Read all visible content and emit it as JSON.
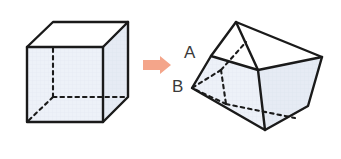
{
  "figure": {
    "canvas": {
      "width": 341,
      "height": 159,
      "background": "#ffffff"
    },
    "colors": {
      "face_fill": "#edf1f8",
      "face_fill_shaded": "#e7ecf5",
      "face_fill_top": "#ffffff",
      "edge_stroke": "#1a1a1a",
      "hidden_stroke": "#1a1a1a",
      "arrow_fill": "#f4a58a",
      "label_color": "#3a3a3a"
    },
    "arrow": {
      "name": "transform-arrow",
      "direction": "right",
      "color": "#f4a58a",
      "x": 143,
      "y": 56,
      "width": 28,
      "height": 18
    },
    "labels": [
      {
        "id": "A",
        "text": "A",
        "x": 184,
        "y": 44
      },
      {
        "id": "B",
        "text": "B",
        "x": 172,
        "y": 78
      }
    ],
    "shapes": [
      {
        "name": "upright-cube",
        "description": "Standard axonometric cube, front face square, hidden back edges dashed",
        "vertices": {
          "front_top_left": [
            27,
            47
          ],
          "front_top_right": [
            103,
            47
          ],
          "front_bottom_right": [
            103,
            122
          ],
          "front_bottom_left": [
            27,
            122
          ],
          "back_top_left": [
            53,
            22
          ],
          "back_top_right": [
            128,
            22
          ],
          "back_bottom_right": [
            128,
            97
          ],
          "back_bottom_left": [
            53,
            97
          ]
        },
        "visible_faces": [
          "front",
          "top",
          "right"
        ],
        "hidden_edges": [
          "back_bottom_left-front_bottom_left",
          "back_bottom_left-back_top_left",
          "back_bottom_left-back_bottom_right"
        ]
      },
      {
        "name": "tilted-cube",
        "description": "Same cube rotated/tipped forward; vertex A on upper-left of top face, vertex B at far-left bottom",
        "vertices": {
          "top_apex": [
            236,
            22
          ],
          "top_right": [
            322,
            57
          ],
          "A": [
            211,
            56
          ],
          "top_inner": [
            258,
            70
          ],
          "B": [
            192,
            88
          ],
          "bottom_front": [
            265,
            130
          ],
          "right_lower": [
            308,
            106
          ],
          "hidden_mid": [
            221,
            70
          ]
        },
        "visible_faces": [
          "top",
          "left-front",
          "right"
        ],
        "hidden_edges": [
          "hidden_mid-B",
          "hidden_mid-top_inner",
          "hidden_mid-down",
          "B-bottom_front",
          "bottom_front-right_lower"
        ]
      }
    ]
  }
}
